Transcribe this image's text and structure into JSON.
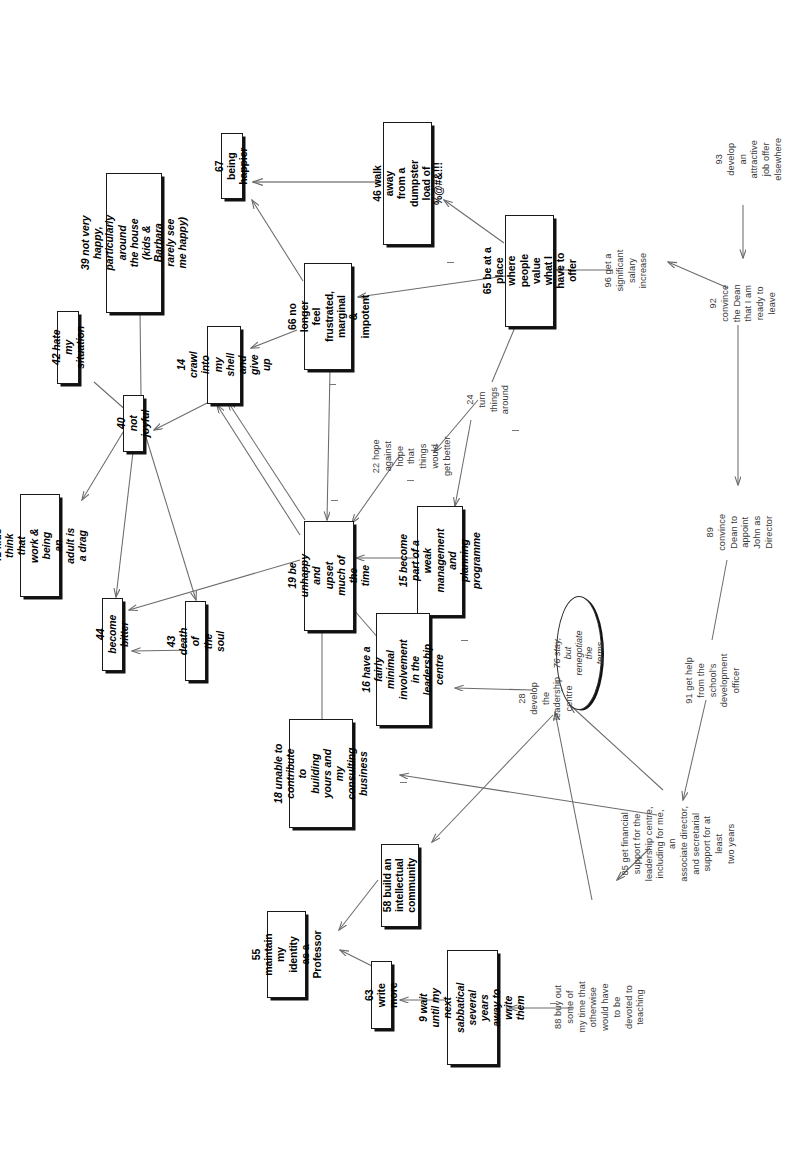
{
  "diagram": {
    "type": "causal-cognitive-map",
    "orientation": "text rotated 90 degrees counter-clockwise",
    "nodes": [
      {
        "id": "39",
        "label": "39 not very happy,\nparticularly around\nthe house (kids &\nBarbara rarely see\nme happy)",
        "style": "box-italic"
      },
      {
        "id": "42",
        "label": "42 hate my situation",
        "style": "box-italic"
      },
      {
        "id": "41",
        "label": "41 kids think that\nwork & being an\nadult is a drag",
        "style": "box-italic"
      },
      {
        "id": "40",
        "label": "40 not joyful",
        "style": "box-italic"
      },
      {
        "id": "44",
        "label": "44 become bitter",
        "style": "box-italic"
      },
      {
        "id": "43",
        "label": "43 death of the soul",
        "style": "box-italic"
      },
      {
        "id": "67",
        "label": "67 being happier",
        "style": "box-bold"
      },
      {
        "id": "14",
        "label": "14 crawl into my\nshell and give up",
        "style": "box-italic"
      },
      {
        "id": "46",
        "label": "46 walk away from a\ndumpster load of\n%@#&!!!",
        "style": "box-bold"
      },
      {
        "id": "66",
        "label": "66 no longer feel\nfrustrated, marginal\n& impotent",
        "style": "box-bold"
      },
      {
        "id": "65",
        "label": "65 be at a place\nwhere people value\nwhat I have to offer",
        "style": "box-bold"
      },
      {
        "id": "19",
        "label": "19 be unhappy and\nupset much of the\ntime",
        "style": "box-italic"
      },
      {
        "id": "15",
        "label": "15 become part of a\nweak management and\nplanning programme",
        "style": "box-italic"
      },
      {
        "id": "16",
        "label": "16 have a fairly\nminimal involvement\nin the leadership\ncentre",
        "style": "box-italic"
      },
      {
        "id": "18",
        "label": "18 unable to\ncontribute to\nbuilding yours and\nmy consulting\nbusiness",
        "style": "box-italic"
      },
      {
        "id": "58",
        "label": "58 build an\nintellectual\ncommunity",
        "style": "box-bold"
      },
      {
        "id": "55",
        "label": "55 maintain my\nidentity as a\nProfessor",
        "style": "box-bold"
      },
      {
        "id": "63",
        "label": "63 write more",
        "style": "box-bold"
      },
      {
        "id": "9",
        "label": "9 wait until my next\nsabbatical several\nyears away to write\nthem",
        "style": "box-italic"
      },
      {
        "id": "76",
        "label": "76 stay, but\nrenegotiate the\nterms",
        "style": "oval-italic"
      },
      {
        "id": "22",
        "label": "22 hope against hope\nthat things would\nget better",
        "style": "plain"
      },
      {
        "id": "24",
        "label": "24 turn things\naround",
        "style": "plain"
      },
      {
        "id": "28",
        "label": "28 develop the\nleadership centre",
        "style": "plain"
      },
      {
        "id": "96",
        "label": "96 get a significant\nsalary increase",
        "style": "plain"
      },
      {
        "id": "93",
        "label": "93 develop an\nattractive job offer\nelsewhere",
        "style": "plain"
      },
      {
        "id": "92",
        "label": "92 convince the Dean\nthat I am ready to\nleave",
        "style": "plain"
      },
      {
        "id": "89",
        "label": "89 convince Dean to\nappoint John as\nDirector",
        "style": "plain"
      },
      {
        "id": "91",
        "label": "91 get help from the\nschool's development\nofficer",
        "style": "plain"
      },
      {
        "id": "85",
        "label": "85 get financial\nsupport for the\nleadership centre,\nincluding for me, an\nassociate director,\nand secretarial\nsupport for at least\ntwo years",
        "style": "plain"
      },
      {
        "id": "88",
        "label": "88 buy out some of\nmy time that\notherwise would have\nto be devoted to\nteaching",
        "style": "plain"
      }
    ],
    "colors": {
      "node_border": "#1a1a1a",
      "node_shadow": "#111111",
      "link": "#6b6b6b",
      "text": "#000000",
      "plain_text": "#3a3a3a",
      "background": "#ffffff"
    }
  }
}
